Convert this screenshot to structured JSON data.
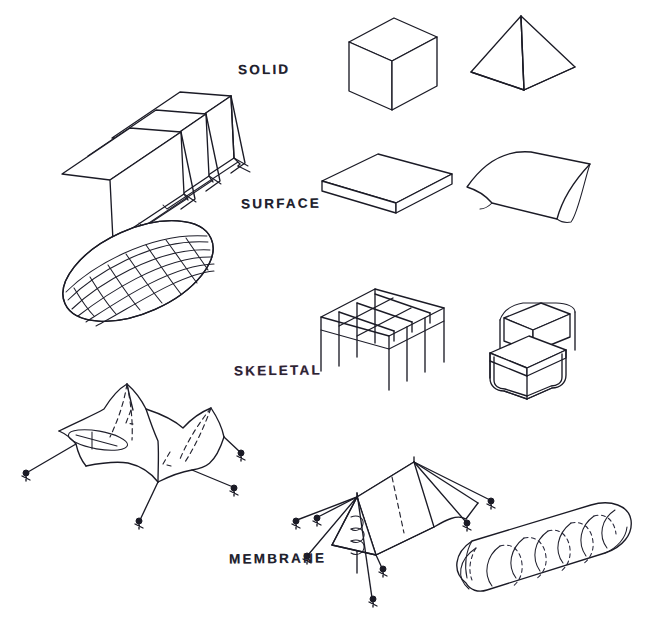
{
  "sheet": {
    "title": "Structural typologies hand sketch",
    "background_color": "#ffffff",
    "ink_color": "#1b1b26",
    "width": 649,
    "height": 622
  },
  "rows": [
    {
      "id": "solid",
      "label": "SOLID",
      "label_x": 238,
      "label_y": 62,
      "tinted": false,
      "figures": [
        {
          "name": "folded-plate-slab",
          "caption": "folded plate / zigzag slab"
        },
        {
          "name": "cube",
          "caption": "cube"
        },
        {
          "name": "pyramid",
          "caption": "pyramid"
        }
      ]
    },
    {
      "id": "surface",
      "label": "SURFACE",
      "label_x": 241,
      "label_y": 196,
      "tinted": false,
      "figures": [
        {
          "name": "flat-slab",
          "caption": "flat slab"
        },
        {
          "name": "curved-shell",
          "caption": "curved shell vault"
        }
      ]
    },
    {
      "id": "skeletal",
      "label": "SKELETAL",
      "label_x": 234,
      "label_y": 363,
      "tinted": true,
      "figures": [
        {
          "name": "lattice-ellipsoid",
          "caption": "gridshell ellipsoid dome"
        },
        {
          "name": "space-frame",
          "caption": "post and beam grid frame"
        },
        {
          "name": "tubular-chair",
          "caption": "cantilever tubular steel chair"
        }
      ]
    },
    {
      "id": "membrane",
      "label": "MEMBRANE",
      "label_x": 229,
      "label_y": 551,
      "tinted": false,
      "figures": [
        {
          "name": "tensile-canopy",
          "caption": "tensile fabric canopy with masts"
        },
        {
          "name": "ridge-tent",
          "caption": "guyed ridge tent"
        },
        {
          "name": "inflatable-tube",
          "caption": "air supported inflatable tube"
        }
      ]
    }
  ]
}
